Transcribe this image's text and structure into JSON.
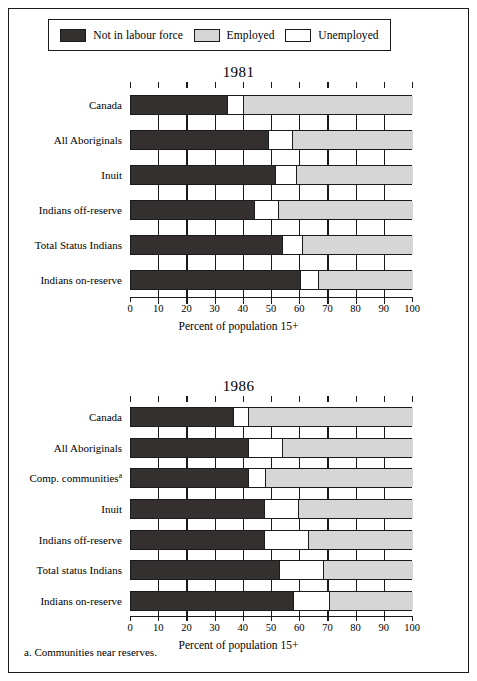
{
  "legend": {
    "items": [
      {
        "label": "Not in labour force",
        "color": "#33302f",
        "key": "not_in_labour_force"
      },
      {
        "label": "Employed",
        "color": "#d6d6d6",
        "key": "employed"
      },
      {
        "label": "Unemployed",
        "color": "#ffffff",
        "key": "unemployed"
      }
    ]
  },
  "footnote": "a. Communities near reserves.",
  "axis": {
    "ticks": [
      "0",
      "10",
      "20",
      "30",
      "40",
      "50",
      "60",
      "70",
      "80",
      "90",
      "100"
    ],
    "title": "Percent of population 15+"
  },
  "chart_data": [
    {
      "type": "bar",
      "orientation": "horizontal",
      "stacked": true,
      "title": "1981",
      "xlabel": "Percent of population 15+",
      "ylabel": "",
      "xlim": [
        0,
        100
      ],
      "xticks": [
        0,
        10,
        20,
        30,
        40,
        50,
        60,
        70,
        80,
        90,
        100
      ],
      "grid": false,
      "legend_position": "top",
      "categories": [
        "Canada",
        "All Aboriginals",
        "Inuit",
        "Indians off-reserve",
        "Total Status Indians",
        "Indians on-reserve"
      ],
      "series": [
        {
          "name": "Not in labour force",
          "color": "#33302f",
          "values": [
            34,
            48.5,
            51,
            43.5,
            53.5,
            60
          ]
        },
        {
          "name": "Unemployed",
          "color": "#ffffff",
          "values": [
            6,
            9,
            8,
            9,
            7.5,
            6.5
          ]
        },
        {
          "name": "Employed",
          "color": "#d6d6d6",
          "values": [
            60,
            42.5,
            41,
            47.5,
            39,
            33.5
          ]
        }
      ]
    },
    {
      "type": "bar",
      "orientation": "horizontal",
      "stacked": true,
      "title": "1986",
      "xlabel": "Percent of population 15+",
      "ylabel": "",
      "xlim": [
        0,
        100
      ],
      "xticks": [
        0,
        10,
        20,
        30,
        40,
        50,
        60,
        70,
        80,
        90,
        100
      ],
      "grid": false,
      "legend_position": "top",
      "categories": [
        "Canada",
        "All Aboriginals",
        "Comp. communitiesᵃ",
        "Inuit",
        "Indians off-reserve",
        "Total status Indians",
        "Indians on-reserve"
      ],
      "series": [
        {
          "name": "Not in labour force",
          "color": "#33302f",
          "values": [
            36,
            41.5,
            41.5,
            47,
            47,
            52.5,
            57.5
          ]
        },
        {
          "name": "Unemployed",
          "color": "#ffffff",
          "values": [
            6,
            12.5,
            6.5,
            12.5,
            16,
            16,
            13
          ]
        },
        {
          "name": "Employed",
          "color": "#d6d6d6",
          "values": [
            58,
            46,
            52,
            40.5,
            37,
            31.5,
            29.5
          ]
        }
      ]
    }
  ],
  "charts": [
    {
      "title": "1981",
      "rows": [
        {
          "label": "Canada",
          "label_sup": "",
          "nilf": 34,
          "unemp_end": 40
        },
        {
          "label": "All Aboriginals",
          "label_sup": "",
          "nilf": 48.5,
          "unemp_end": 57.5
        },
        {
          "label": "Inuit",
          "label_sup": "",
          "nilf": 51,
          "unemp_end": 59
        },
        {
          "label": "Indians off-reserve",
          "label_sup": "",
          "nilf": 43.5,
          "unemp_end": 52.5
        },
        {
          "label": "Total Status Indians",
          "label_sup": "",
          "nilf": 53.5,
          "unemp_end": 61
        },
        {
          "label": "Indians on-reserve",
          "label_sup": "",
          "nilf": 60,
          "unemp_end": 66.5
        }
      ]
    },
    {
      "title": "1986",
      "rows": [
        {
          "label": "Canada",
          "label_sup": "",
          "nilf": 36,
          "unemp_end": 42
        },
        {
          "label": "All Aboriginals",
          "label_sup": "",
          "nilf": 41.5,
          "unemp_end": 54
        },
        {
          "label": "Comp. communities",
          "label_sup": "a",
          "nilf": 41.5,
          "unemp_end": 48
        },
        {
          "label": "Inuit",
          "label_sup": "",
          "nilf": 47,
          "unemp_end": 59.5
        },
        {
          "label": "Indians off-reserve",
          "label_sup": "",
          "nilf": 47,
          "unemp_end": 63
        },
        {
          "label": "Total status Indians",
          "label_sup": "",
          "nilf": 52.5,
          "unemp_end": 68.5
        },
        {
          "label": "Indians on-reserve",
          "label_sup": "",
          "nilf": 57.5,
          "unemp_end": 70.5
        }
      ]
    }
  ]
}
